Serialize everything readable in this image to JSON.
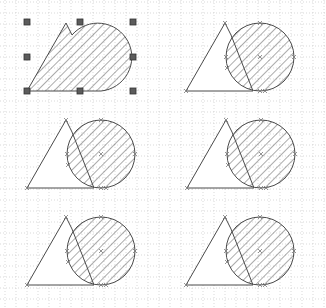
{
  "canvas": {
    "width": 326,
    "height": 308,
    "background": "#ffffff",
    "grid": {
      "spacing": 11,
      "color": "#c8c8c8",
      "dash": "1,2"
    }
  },
  "colors": {
    "stroke": "#4a4a4a",
    "hatch": "#5a5a5a",
    "handle_fill": "#5c5c5c",
    "handle_stroke": "#333333",
    "vertex_marker": "#777777"
  },
  "selection": {
    "shape_index": 0,
    "handles": [
      [
        27,
        22
      ],
      [
        80,
        22
      ],
      [
        133,
        22
      ],
      [
        27,
        57
      ],
      [
        133,
        57
      ],
      [
        27,
        91
      ],
      [
        80,
        91
      ],
      [
        133,
        91
      ]
    ]
  },
  "shapes": [
    {
      "name": "merged-shape-top-left",
      "dx": 0,
      "dy": 0,
      "merged": true
    },
    {
      "name": "shape-top-right",
      "dx": 159,
      "dy": 0,
      "merged": false
    },
    {
      "name": "shape-middle-left",
      "dx": 0,
      "dy": 97,
      "merged": false
    },
    {
      "name": "shape-middle-right",
      "dx": 160,
      "dy": 97,
      "merged": false
    },
    {
      "name": "shape-bottom-left",
      "dx": 0,
      "dy": 194,
      "merged": false
    },
    {
      "name": "shape-bottom-right",
      "dx": 159,
      "dy": 194,
      "merged": false
    }
  ],
  "base_geometry": {
    "triangle": [
      [
        27,
        91
      ],
      [
        66,
        23
      ],
      [
        72,
        35
      ],
      [
        94,
        91
      ]
    ],
    "circle": {
      "cx": 101,
      "cy": 57,
      "r": 34
    }
  }
}
